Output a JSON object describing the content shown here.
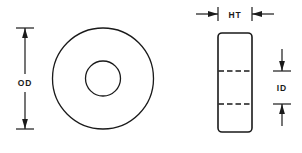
{
  "drawing": {
    "title": "Washer dimension drawing",
    "line_color": "#1a1a1a",
    "background_color": "#ffffff",
    "views": {
      "front": {
        "name": "front-view-annulus",
        "outer_circle": {
          "cx": 103,
          "cy": 78.5,
          "r": 50.5
        },
        "inner_circle": {
          "cx": 103,
          "cy": 78.5,
          "r": 17.5
        }
      },
      "side": {
        "name": "side-view-rectangle",
        "x": 218,
        "y": 33,
        "width": 34,
        "height": 99,
        "corner_radius": 4,
        "hidden_lines": [
          71,
          104
        ]
      }
    },
    "dimensions": [
      {
        "id": "od",
        "label": "OD",
        "orientation": "vertical",
        "axis_x": 25,
        "from": 28,
        "to": 129,
        "tick_half_width": 9,
        "label_y": 83
      },
      {
        "id": "ht",
        "label": "HT",
        "orientation": "horizontal",
        "axis_y": 14,
        "from": 218,
        "to": 252,
        "tick_half_height": 7,
        "label_x": 235,
        "lead_length": 22
      },
      {
        "id": "id",
        "label": "ID",
        "orientation": "vertical",
        "axis_x": 282,
        "from": 71,
        "to": 104,
        "tick_half_width": 9,
        "label_y": 91,
        "lead_length": 22
      }
    ]
  }
}
